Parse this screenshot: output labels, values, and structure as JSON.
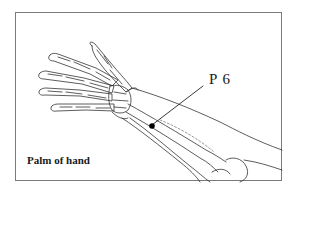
{
  "figure": {
    "caption": "Palm of hand",
    "acupoint": {
      "label": "P 6",
      "marker_color": "#000000"
    },
    "colors": {
      "line": "#333333",
      "frame": "#7a7a7a",
      "background": "#ffffff"
    }
  }
}
